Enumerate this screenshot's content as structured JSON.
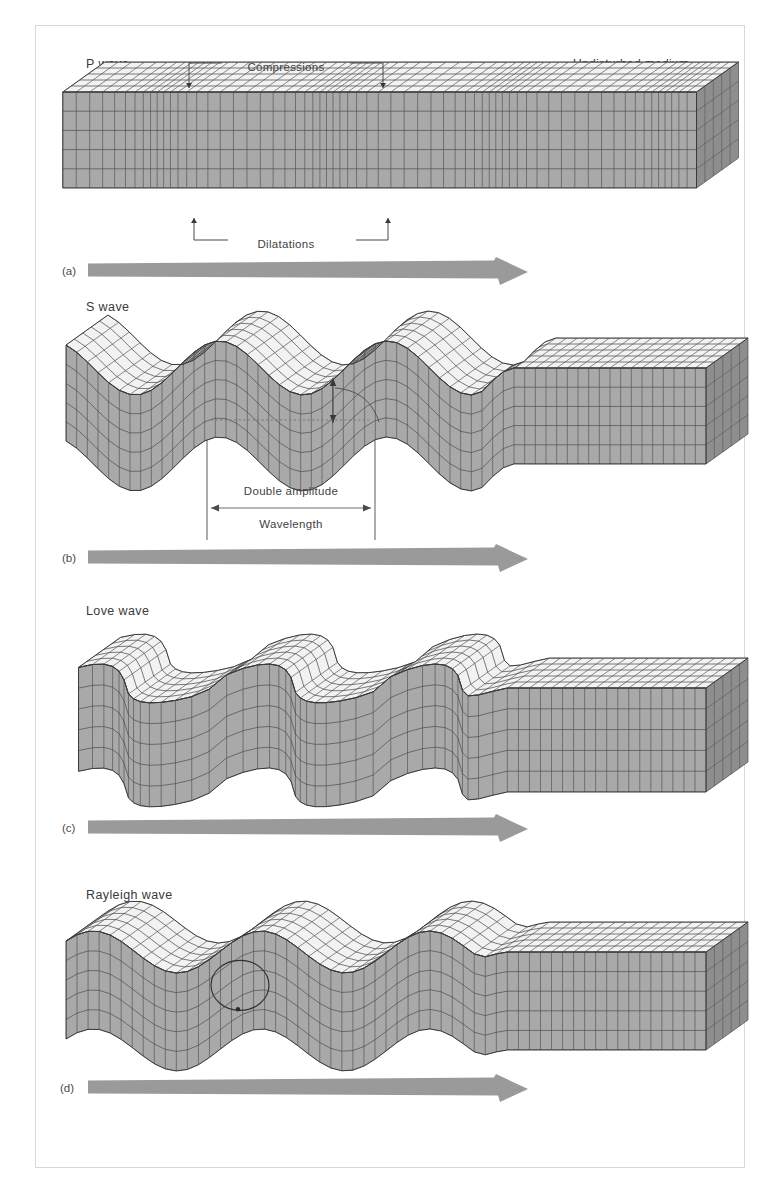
{
  "figure": {
    "background": "#ffffff",
    "border_color": "#d8d8d8",
    "arrow_color": "#9a9a9a",
    "ink_color": "#3a3a3a",
    "top_face_color": "#f2f2f2",
    "front_face_color": "#a9a9a9",
    "end_face_color": "#8e8e8e",
    "grid_color": "#4a4a4a"
  },
  "panels": [
    {
      "id": "p-wave",
      "letter": "(a)",
      "wave_name": "P wave",
      "right_label": "Undisturbed medium",
      "annotations": [
        {
          "name": "compressions",
          "text": "Compressions",
          "position": "above"
        },
        {
          "name": "dilatations",
          "text": "Dilatations",
          "position": "below"
        }
      ],
      "motion": "compressional",
      "propagation_arrow": true
    },
    {
      "id": "s-wave",
      "letter": "(b)",
      "wave_name": "S wave",
      "right_label": "",
      "annotations": [
        {
          "name": "double-amplitude",
          "text": "Double amplitude",
          "position": "below"
        },
        {
          "name": "wavelength",
          "text": "Wavelength",
          "position": "below"
        }
      ],
      "motion": "transverse-vertical",
      "propagation_arrow": true
    },
    {
      "id": "love-wave",
      "letter": "(c)",
      "wave_name": "Love wave",
      "right_label": "",
      "annotations": [],
      "motion": "transverse-horizontal",
      "propagation_arrow": true
    },
    {
      "id": "rayleigh-wave",
      "letter": "(d)",
      "wave_name": "Rayleigh wave",
      "right_label": "",
      "annotations": [
        {
          "name": "particle-orbit",
          "text": "",
          "position": "inline"
        }
      ],
      "motion": "retrograde-elliptical",
      "propagation_arrow": true
    }
  ],
  "chart_data": {
    "type": "diagram",
    "series": [
      {
        "name": "P wave",
        "wave_class": "body",
        "motion": "compressional / longitudinal",
        "grid_effect": "alternating bands of compressed and dilated vertical grid lines",
        "cycles": 2.5,
        "amplitude": 0
      },
      {
        "name": "S wave",
        "wave_class": "body",
        "motion": "transverse, vertical particle motion",
        "cycles": 2.5,
        "amplitude": 26,
        "wavelength_px": 168
      },
      {
        "name": "Love wave",
        "wave_class": "surface",
        "motion": "transverse, horizontal particle motion (shear)",
        "cycles": 2.5,
        "amplitude": 22
      },
      {
        "name": "Rayleigh wave",
        "wave_class": "surface",
        "motion": "retrograde elliptical particle motion",
        "cycles": 2.5,
        "amplitude": 20
      }
    ]
  }
}
